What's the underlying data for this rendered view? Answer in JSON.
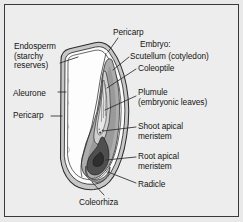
{
  "figure": {
    "type": "botanical-diagram",
    "background_color": "#ededed",
    "frame_color": "#3a3a3a",
    "text_color": "#141414"
  },
  "labels": {
    "left": [
      {
        "id": "endosperm",
        "text": "Endosperm\n(starchy\nreserves)",
        "x": 14,
        "y": 42
      },
      {
        "id": "aleurone",
        "text": "Aleurone",
        "x": 13,
        "y": 89
      },
      {
        "id": "pericarp_left",
        "text": "Pericarp",
        "x": 13,
        "y": 111
      }
    ],
    "top": [
      {
        "id": "pericarp_top",
        "text": "Pericarp",
        "x": 113,
        "y": 28
      }
    ],
    "right": [
      {
        "id": "embryo",
        "text": "Embryo:",
        "x": 140,
        "y": 40
      },
      {
        "id": "scutellum",
        "text": "Scutellum (cotyledon)",
        "x": 131,
        "y": 52
      },
      {
        "id": "coleoptile",
        "text": "Coleoptile",
        "x": 138,
        "y": 64
      },
      {
        "id": "plumule",
        "text": "Plumule\n(embryonic leaves)",
        "x": 138,
        "y": 88
      },
      {
        "id": "shoot_apical_meristem",
        "text": "Shoot apical\nmeristem",
        "x": 138,
        "y": 122
      },
      {
        "id": "root_apical_meristem",
        "text": "Root apical\nmeristem",
        "x": 138,
        "y": 152
      },
      {
        "id": "radicle",
        "text": "Radicle",
        "x": 138,
        "y": 180
      }
    ],
    "bottom": [
      {
        "id": "coleorhiza",
        "text": "Coleorhiza",
        "x": 79,
        "y": 198
      }
    ]
  },
  "colors": {
    "outline": "#2b2b2b",
    "pericarp_fill": "#c9c9c9",
    "endosperm_fill": "#fcfcfc",
    "scutellum_fill": "#b3b3b3",
    "embryo_fill": "#8f8f8f",
    "radicle_fill": "#4a4a4a",
    "leader_line": "#2b2b2b"
  }
}
